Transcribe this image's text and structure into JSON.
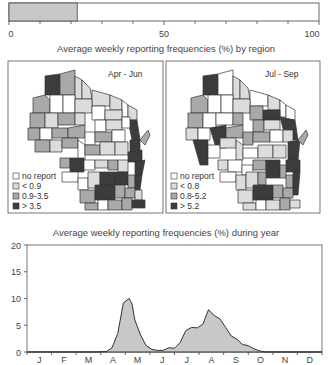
{
  "top_bar": {
    "ticks": [
      "0",
      "50",
      "100"
    ],
    "value": 22,
    "max": 100
  },
  "maps_title": "Average weekly reporting frequencies (%) by region",
  "maps": [
    {
      "period": "Apr - Jun",
      "legend": [
        "no report",
        "< 0.9",
        "0.9-3.5",
        "> 3.5"
      ]
    },
    {
      "period": "Jul - Sep",
      "legend": [
        "no report",
        "< 0.8",
        "0.8-5.2",
        "> 5.2"
      ]
    }
  ],
  "chart_title": "Average weekly reporting frequencies (%) during year",
  "chart_data": [
    {
      "type": "bar",
      "title": "",
      "orientation": "horizontal",
      "categories": [
        "overall"
      ],
      "values": [
        22
      ],
      "xlim": [
        0,
        100
      ],
      "tick_labels": [
        "0",
        "50",
        "100"
      ]
    },
    {
      "type": "area",
      "title": "Average weekly reporting frequencies (%) during year",
      "xlabel": "",
      "ylabel": "",
      "ylim": [
        0,
        20
      ],
      "yticks": [
        0,
        5,
        10,
        15,
        20
      ],
      "categories": [
        "J",
        "F",
        "M",
        "A",
        "M",
        "J",
        "J",
        "A",
        "S",
        "O",
        "N",
        "D"
      ],
      "x_week": [
        0,
        4,
        8,
        12,
        14,
        15,
        16,
        17,
        18,
        18.5,
        19,
        20,
        21,
        22,
        23,
        24,
        25,
        26,
        27,
        28,
        29,
        30,
        31,
        32,
        33,
        34,
        35,
        36,
        37,
        38,
        39,
        40,
        41,
        42,
        43,
        44,
        48,
        52
      ],
      "values": [
        0,
        0,
        0,
        0,
        0.1,
        0.8,
        3.5,
        9.2,
        10.0,
        9.0,
        6.0,
        3.2,
        1.2,
        0.5,
        0.3,
        0.3,
        0.8,
        0.7,
        1.8,
        4.0,
        4.6,
        4.5,
        5.2,
        7.9,
        6.8,
        6.2,
        4.6,
        3.0,
        2.4,
        1.4,
        1.2,
        0.6,
        0.2,
        0,
        0,
        0,
        0,
        0
      ],
      "grid": false,
      "legend": []
    }
  ]
}
